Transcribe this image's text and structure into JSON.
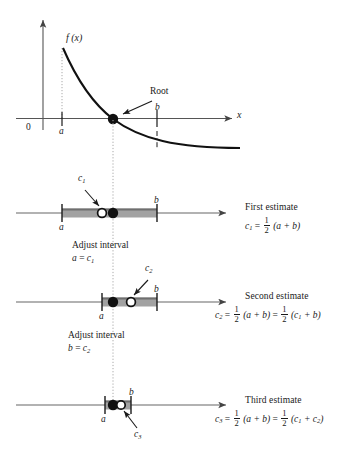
{
  "figure": {
    "colors": {
      "ink": "#1a1a1a",
      "axis": "#555555",
      "band": "#a0a0a0",
      "band_edge": "#6e6e6e",
      "dotted": "#9a9a9a"
    }
  },
  "graph": {
    "function_label": "f (x)",
    "y_axis_name": "y-axis",
    "x_axis_label": "x",
    "origin_label": "0",
    "root_label": "Root",
    "tick_a": "a",
    "tick_b": "b"
  },
  "rows": [
    {
      "id": "first",
      "tick_left": "a",
      "tick_right": "b",
      "point_label": "c",
      "point_sub": "1",
      "title": "First estimate",
      "formula_parts": {
        "lhs": "c",
        "lhs_sub": "1",
        "eq": "=",
        "num": "1",
        "den": "2",
        "rhs": "(a + b)"
      }
    },
    {
      "id": "second",
      "tick_left": "a",
      "tick_right": "b",
      "point_label": "c",
      "point_sub": "2",
      "title": "Second estimate",
      "formula_parts": {
        "lhs": "c",
        "lhs_sub": "2",
        "eq": "=",
        "num": "1",
        "den": "2",
        "rhs": "(a + b)",
        "eq2": "=",
        "num2": "1",
        "den2": "2",
        "rhs2_pre": "(c",
        "rhs2_sub": "1",
        "rhs2_post": " + b)"
      }
    },
    {
      "id": "third",
      "tick_left": "a",
      "tick_right": "b",
      "point_label": "c",
      "point_sub": "3",
      "title": "Third estimate",
      "formula_parts": {
        "lhs": "c",
        "lhs_sub": "3",
        "eq": "=",
        "num": "1",
        "den": "2",
        "rhs": "(a + b)",
        "eq2": "=",
        "num2": "1",
        "den2": "2",
        "rhs2_pre": "(c",
        "rhs2_sub": "1",
        "rhs2_mid": " + c",
        "rhs2_sub2": "2",
        "rhs2_post": ")"
      }
    }
  ],
  "adjust_notes": [
    {
      "id": "adjust-1",
      "line1": "Adjust interval",
      "line2_lhs": "a",
      "line2_eq": "=",
      "line2_rhs": "c",
      "line2_sub": "1"
    },
    {
      "id": "adjust-2",
      "line1": "Adjust interval",
      "line2_lhs": "b",
      "line2_eq": "=",
      "line2_rhs": "c",
      "line2_sub": "2"
    }
  ]
}
